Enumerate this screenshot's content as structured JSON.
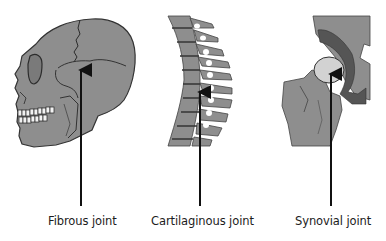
{
  "diagram": {
    "panels": [
      {
        "id": "fibrous",
        "illustration": "skull-lateral-view",
        "label": "Fibrous joint",
        "arrow_target": "cranial suture"
      },
      {
        "id": "cartilaginous",
        "illustration": "vertebral-column",
        "label": "Cartilaginous joint",
        "arrow_target": "intervertebral disc"
      },
      {
        "id": "synovial",
        "illustration": "hip-joint",
        "label": "Synovial joint",
        "arrow_target": "femoral head in acetabulum"
      }
    ],
    "colors": {
      "bone_fill": "#8e8e8e",
      "bone_dark": "#5a5a5a",
      "outline": "#3a3a3a",
      "cartilage_light": "#d2d2d2",
      "arrow": "#111111",
      "background": "#ffffff"
    }
  }
}
